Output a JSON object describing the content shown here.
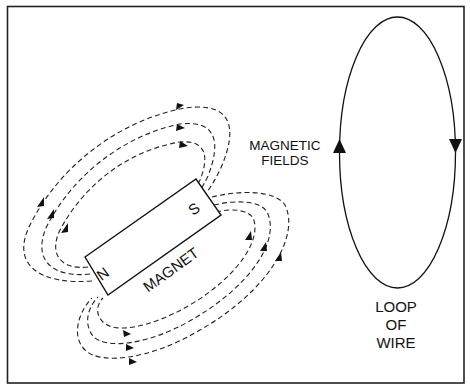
{
  "diagram": {
    "labels": {
      "magnet": "MAGNET",
      "north_pole": "N",
      "south_pole": "S",
      "fields_line1": "MAGNETIC",
      "fields_line2": "FIELDS",
      "loop_line1": "LOOP",
      "loop_line2": "OF",
      "loop_line3": "WIRE"
    },
    "elements": [
      {
        "id": "magnet",
        "type": "rectangle",
        "rotation_deg": -36
      },
      {
        "id": "upper-field-lines",
        "type": "dashed-loops",
        "count": 3,
        "arrow_direction": "clockwise"
      },
      {
        "id": "lower-field-lines",
        "type": "dashed-loops",
        "count": 3,
        "arrow_direction": "counterclockwise"
      },
      {
        "id": "wire-loop",
        "type": "ellipse",
        "arrows": [
          "up on left side",
          "down on right side"
        ]
      }
    ],
    "colors": {
      "line": "#111111",
      "background": "#ffffff"
    }
  }
}
